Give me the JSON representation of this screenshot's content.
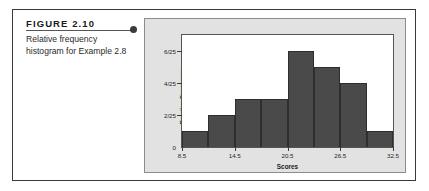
{
  "figure": {
    "label": "FIGURE 2.10",
    "caption_lines": [
      "Relative frequency",
      "histogram for Example 2.8"
    ],
    "bullet_icon": "bullet-dot-icon"
  },
  "colors": {
    "bar_fill": "#4a4a4a",
    "bar_stroke": "#2e2e2e",
    "panel_background": "#e2e2e2",
    "plot_background": "#ffffff",
    "frame": "#3a3a3a"
  },
  "chart_data": {
    "type": "bar",
    "title": "",
    "xlabel": "Scores",
    "ylabel": "Relative Frequency",
    "categories": [
      "8.5-11.5",
      "11.5-14.5",
      "14.5-17.5",
      "17.5-20.5",
      "20.5-23.5",
      "23.5-26.5",
      "26.5-29.5",
      "29.5-32.5"
    ],
    "bin_edges": [
      8.5,
      11.5,
      14.5,
      17.5,
      20.5,
      23.5,
      26.5,
      29.5,
      32.5
    ],
    "values": [
      0.04,
      0.08,
      0.12,
      0.12,
      0.24,
      0.2,
      0.16,
      0.04
    ],
    "value_labels": [
      "1/25",
      "2/25",
      "3/25",
      "3/25",
      "6/25",
      "5/25",
      "4/25",
      "1/25"
    ],
    "xlim": [
      8.5,
      32.5
    ],
    "ylim": [
      0,
      0.28
    ],
    "xtick_values": [
      8.5,
      14.5,
      20.5,
      26.5,
      32.5
    ],
    "xtick_labels": [
      "8.5",
      "14.5",
      "20.5",
      "26.5",
      "32.5"
    ],
    "ytick_values": [
      0,
      0.08,
      0.16,
      0.24
    ],
    "ytick_labels": [
      "0",
      "2/25",
      "4/25",
      "6/25"
    ],
    "grid": false,
    "legend": null
  }
}
